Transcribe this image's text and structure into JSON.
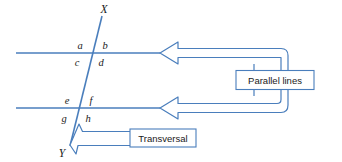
{
  "figure": {
    "type": "geometry-diagram",
    "background_color": "#ffffff",
    "stroke_color": "#4a7ebc",
    "stroke_color_light": "#6f9fd4",
    "text_color": "#1a1a1a"
  },
  "endpoints": {
    "top": "X",
    "bottom": "Y"
  },
  "angle_labels": {
    "upper_intersection": {
      "top_left": "a",
      "top_right": "b",
      "bottom_left": "c",
      "bottom_right": "d"
    },
    "lower_intersection": {
      "top_left": "e",
      "top_right": "f",
      "bottom_left": "g",
      "bottom_right": "h"
    }
  },
  "callouts": {
    "parallel_lines": {
      "label": "Parallel lines",
      "arrow_count": 2,
      "points_to": [
        "upper-horizontal-line",
        "lower-horizontal-line"
      ]
    },
    "transversal": {
      "label": "Transversal",
      "arrow_count": 1,
      "points_to": "transversal-line"
    }
  },
  "lines": {
    "upper_parallel": {
      "name": "upper parallel line"
    },
    "lower_parallel": {
      "name": "lower parallel line"
    },
    "transversal": {
      "name": "transversal line from X to Y"
    }
  }
}
